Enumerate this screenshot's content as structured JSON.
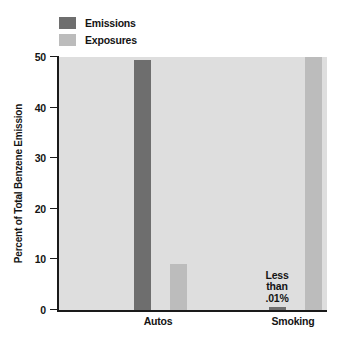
{
  "chart_data": {
    "type": "bar",
    "title": "",
    "xlabel": "",
    "ylabel": "Percent of Total Benzene Emission",
    "categories": [
      "Autos",
      "Smoking"
    ],
    "ylim": [
      0,
      50
    ],
    "yticks": [
      0,
      10,
      20,
      30,
      40,
      50
    ],
    "ytick_labels": [
      "0",
      "10",
      "20",
      "30",
      "40",
      "50"
    ],
    "grid": false,
    "legend_position": "top-left",
    "series": [
      {
        "name": "Emissions",
        "color": "#6e6e6e",
        "values": [
          49.5,
          0.01
        ]
      },
      {
        "name": "Exposures",
        "color": "#bcbcbc",
        "values": [
          9,
          50
        ]
      }
    ],
    "annotations": [
      {
        "text_lines": [
          "Less",
          "than",
          ".01%"
        ],
        "target_series": "Emissions",
        "target_category": "Smoking"
      }
    ],
    "colors": {
      "plot_background": "#dedede",
      "axis": "#1a1a1a",
      "text": "#141414",
      "page_background": "#ffffff"
    }
  }
}
